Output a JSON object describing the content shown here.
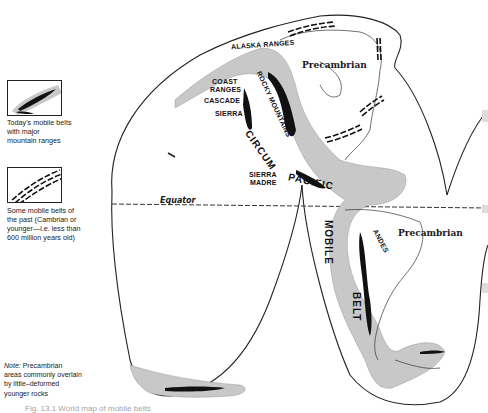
{
  "figure": {
    "type": "geological world map (interrupted projection, Western Hemisphere)",
    "colors": {
      "outline": "#222222",
      "mobile_belt_fill": "#c8c8c8",
      "mountain_range_fill": "#111111",
      "background": "#ffffff"
    }
  },
  "legend": {
    "items": [
      {
        "symbol": "gray belt with black mountain core",
        "label": "Today's mobile belts with major mountain ranges"
      },
      {
        "symbol": "parallel dashed lines",
        "label": "Some mobile belts of the past (Cambrian or younger—i.e. less than 600 million years old)"
      }
    ],
    "item1_line1": "Today's mobile belts",
    "item1_line2": "with major",
    "item1_line3": "mountain ranges",
    "item2_line1": "Some mobile belts of",
    "item2_line2": "the past (Cambrian or",
    "item2_line3": "younger—i.e. less than",
    "item2_line4": "600 million years old)"
  },
  "note": {
    "prefix": "Note:",
    "line1": "Precambrian",
    "line2": "areas commonly overlain",
    "line3": "by little–deformed",
    "line4": "younger rocks"
  },
  "map_labels": {
    "alaska_ranges": "ALASKA RANGES",
    "coast_ranges_1": "COAST",
    "coast_ranges_2": "RANGES",
    "cascade": "CASCADE",
    "sierra": "SIERRA",
    "rocky_mountains": "ROCKY MOUNTAINS",
    "precambrian_north": "Precambrian",
    "precambrian_south": "Precambrian",
    "circum": "CIRCUM",
    "pacific": "PACIFIC",
    "sierra_madre_1": "SIERRA",
    "sierra_madre_2": "MADRE",
    "equator": "Equator",
    "mobile": "MOBILE",
    "belt": "BELT",
    "andes": "ANDES"
  },
  "caption": {
    "text": "Fig. 13.1  World map of mobile belts"
  }
}
